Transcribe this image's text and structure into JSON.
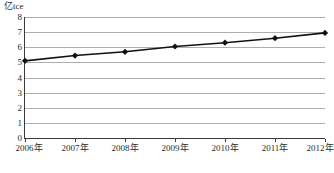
{
  "chart_data": {
    "type": "line",
    "title": "",
    "subtitle": "",
    "unit_label": "亿tce",
    "xlabel": "",
    "ylabel": "",
    "categories": [
      "2006年",
      "2007年",
      "2008年",
      "2009年",
      "2010年",
      "2011年",
      "2012年"
    ],
    "series": [
      {
        "name": "能源消费总量",
        "values": [
          5.1,
          5.45,
          5.7,
          6.05,
          6.3,
          6.6,
          6.95
        ]
      }
    ],
    "ylim": [
      0,
      8
    ],
    "ytick_labels": [
      "8",
      "7",
      "6",
      "5",
      "4",
      "3",
      "2",
      "1",
      "0"
    ],
    "ytick_values": [
      8,
      7,
      6,
      5,
      4,
      3,
      2,
      1,
      0
    ],
    "grid": true,
    "legend": false,
    "legend_position": "none",
    "marker": "diamond",
    "line_color": "#111111",
    "marker_color": "#111111",
    "grid_color": "#aeaeae",
    "axis_color": "#3a3a3a",
    "background_color": "#ffffff"
  }
}
